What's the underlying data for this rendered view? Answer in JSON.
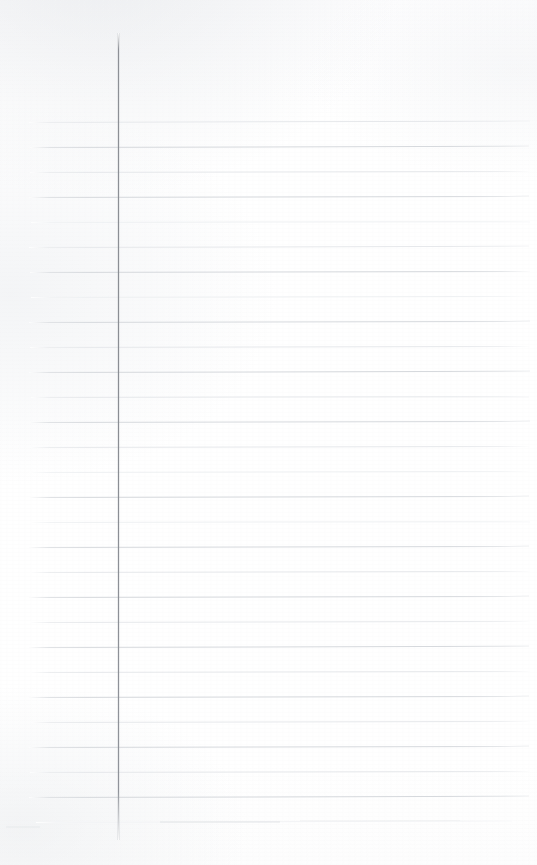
{
  "document": {
    "kind": "scanned-ruled-notebook-page",
    "title": "Blank ruled notebook page",
    "page_width": 537,
    "page_height": 865,
    "body_text": "",
    "has_text_content": false,
    "orientation": "portrait"
  },
  "colors": {
    "page_background": "#fefefe",
    "paper_tint": "#fdfdfe",
    "horizontal_rule": "#d6d9dd",
    "horizontal_rule_faint": "#e6e8eb",
    "horizontal_rule_fainter": "#eef0f2",
    "horizontal_rule_ghost": "#f2f3f5",
    "margin_rule": "#8a8d93",
    "smudge": "#ced1d6"
  },
  "margin_rule": {
    "name": "vertical-margin-line",
    "x": 117.5,
    "y_start": 33,
    "y_end": 840,
    "thickness": 1,
    "color": "#8a8d93"
  },
  "rules": {
    "count": 29,
    "first_y": 122,
    "spacing": 24.95,
    "x_start": 28,
    "x_end": 530,
    "tilt_deg": -0.12,
    "lines": [
      {
        "y": 122,
        "x1": 29,
        "x2": 530,
        "weight": "faint",
        "tilt": -0.16
      },
      {
        "y": 147,
        "x1": 30,
        "x2": 529,
        "weight": "normal",
        "tilt": -0.14
      },
      {
        "y": 171.5,
        "x1": 30,
        "x2": 530,
        "weight": "faint",
        "tilt": -0.12
      },
      {
        "y": 196.5,
        "x1": 29,
        "x2": 529,
        "weight": "normal",
        "tilt": -0.13
      },
      {
        "y": 221.5,
        "x1": 31,
        "x2": 530,
        "weight": "fainter",
        "tilt": -0.1
      },
      {
        "y": 246.5,
        "x1": 29,
        "x2": 529,
        "weight": "faint",
        "tilt": -0.14
      },
      {
        "y": 271.5,
        "x1": 30,
        "x2": 530,
        "weight": "normal",
        "tilt": -0.12
      },
      {
        "y": 296.5,
        "x1": 31,
        "x2": 529,
        "weight": "fainter",
        "tilt": -0.11
      },
      {
        "y": 321.5,
        "x1": 29,
        "x2": 530,
        "weight": "normal",
        "tilt": -0.13
      },
      {
        "y": 346.5,
        "x1": 30,
        "x2": 529,
        "weight": "faint",
        "tilt": -0.12
      },
      {
        "y": 371.5,
        "x1": 29,
        "x2": 530,
        "weight": "normal",
        "tilt": -0.14
      },
      {
        "y": 396.5,
        "x1": 31,
        "x2": 529,
        "weight": "faint",
        "tilt": -0.1
      },
      {
        "y": 421.5,
        "x1": 29,
        "x2": 530,
        "weight": "normal",
        "tilt": -0.13
      },
      {
        "y": 446.5,
        "x1": 30,
        "x2": 529,
        "weight": "faint",
        "tilt": -0.12
      },
      {
        "y": 471.5,
        "x1": 29,
        "x2": 530,
        "weight": "fainter",
        "tilt": -0.11
      },
      {
        "y": 496.5,
        "x1": 30,
        "x2": 529,
        "weight": "normal",
        "tilt": -0.13
      },
      {
        "y": 521.5,
        "x1": 31,
        "x2": 530,
        "weight": "fainter",
        "tilt": -0.1
      },
      {
        "y": 546.5,
        "x1": 29,
        "x2": 529,
        "weight": "normal",
        "tilt": -0.13
      },
      {
        "y": 571.5,
        "x1": 30,
        "x2": 530,
        "weight": "faint",
        "tilt": -0.12
      },
      {
        "y": 596.5,
        "x1": 29,
        "x2": 529,
        "weight": "normal",
        "tilt": -0.13
      },
      {
        "y": 621.5,
        "x1": 31,
        "x2": 530,
        "weight": "faint",
        "tilt": -0.11
      },
      {
        "y": 646.5,
        "x1": 29,
        "x2": 529,
        "weight": "normal",
        "tilt": -0.14
      },
      {
        "y": 671.5,
        "x1": 30,
        "x2": 530,
        "weight": "faint",
        "tilt": -0.12
      },
      {
        "y": 696.5,
        "x1": 29,
        "x2": 529,
        "weight": "normal",
        "tilt": -0.13
      },
      {
        "y": 721.5,
        "x1": 31,
        "x2": 530,
        "weight": "faint",
        "tilt": -0.11
      },
      {
        "y": 746.5,
        "x1": 29,
        "x2": 529,
        "weight": "normal",
        "tilt": -0.13
      },
      {
        "y": 771.5,
        "x1": 30,
        "x2": 530,
        "weight": "faint",
        "tilt": -0.12
      },
      {
        "y": 796.5,
        "x1": 29,
        "x2": 529,
        "weight": "normal",
        "tilt": -0.14
      },
      {
        "y": 822,
        "x1": 36,
        "x2": 512,
        "weight": "ghost",
        "tilt": -0.18
      }
    ]
  },
  "smudges": [
    {
      "name": "bottom-left-smear",
      "x": 6,
      "y": 826,
      "w": 34,
      "h": 2,
      "opacity": 0.3
    },
    {
      "name": "bottom-mid-smear",
      "x": 160,
      "y": 821,
      "w": 120,
      "h": 2,
      "opacity": 0.45
    },
    {
      "name": "bottom-right-smear",
      "x": 300,
      "y": 820,
      "w": 160,
      "h": 1,
      "opacity": 0.28
    }
  ]
}
